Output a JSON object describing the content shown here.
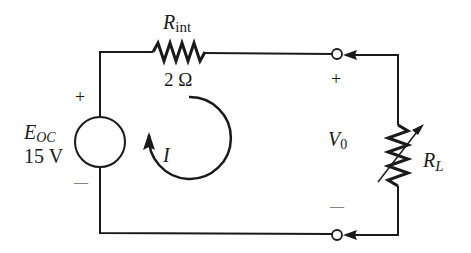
{
  "diagram": {
    "type": "circuit",
    "source": {
      "symbol": "E",
      "subscript": "OC",
      "value": "15 V",
      "plus": "+",
      "minus": "—"
    },
    "internal_resistor": {
      "symbol": "R",
      "subscript": "int",
      "value": "2 Ω"
    },
    "current": {
      "symbol": "I",
      "direction": "clockwise"
    },
    "output": {
      "symbol": "V",
      "subscript": "0",
      "plus": "+",
      "minus": "—"
    },
    "load_resistor": {
      "symbol": "R",
      "subscript": "L",
      "variable": true
    }
  },
  "colors": {
    "line": "#1a1a1a",
    "background": "#ffffff"
  }
}
